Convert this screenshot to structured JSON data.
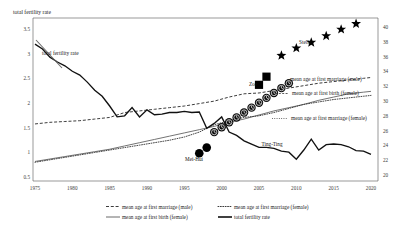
{
  "chart_data": {
    "type": "line",
    "title": "",
    "ylabel_left": "total fertility rate",
    "ylabel_right": "",
    "xlabel": "",
    "grid": false,
    "xlim": [
      1974,
      2021
    ],
    "ylim_left": [
      0.5,
      3.5
    ],
    "ylim_right": [
      20,
      40
    ],
    "xticks": [
      "1975",
      "1980",
      "1985",
      "1990",
      "1995",
      "2000",
      "2005",
      "2010",
      "2015",
      "2020"
    ],
    "yticks_left": [
      "3.5",
      "3",
      "2.5",
      "2",
      "1.5",
      "1",
      "0.5"
    ],
    "yticks_right": [
      "40",
      "38",
      "36",
      "34",
      "32",
      "30",
      "28",
      "26",
      "24",
      "22",
      "20"
    ],
    "legend_position": "bottom",
    "series": [
      {
        "name": "total fertility rate",
        "style": "solid-thick",
        "axis": "left",
        "x": [
          1975,
          1976,
          1977,
          1978,
          1979,
          1980,
          1981,
          1982,
          1983,
          1984,
          1985,
          1986,
          1987,
          1988,
          1989,
          1990,
          1991,
          1992,
          1993,
          1994,
          1995,
          1996,
          1997,
          1998,
          1999,
          2000,
          2001,
          2002,
          2003,
          2004,
          2005,
          2006,
          2007,
          2008,
          2009,
          2010,
          2011,
          2012,
          2013,
          2014,
          2015,
          2016,
          2017,
          2018,
          2019,
          2020
        ],
        "values": [
          3.02,
          2.93,
          2.78,
          2.69,
          2.62,
          2.52,
          2.45,
          2.32,
          2.17,
          2.06,
          1.88,
          1.68,
          1.7,
          1.85,
          1.68,
          1.81,
          1.72,
          1.73,
          1.76,
          1.76,
          1.78,
          1.76,
          1.77,
          1.47,
          1.56,
          1.68,
          1.4,
          1.34,
          1.24,
          1.18,
          1.12,
          1.12,
          1.1,
          1.05,
          1.03,
          0.9,
          1.07,
          1.27,
          1.07,
          1.17,
          1.18,
          1.17,
          1.13,
          1.06,
          1.05,
          0.99
        ]
      },
      {
        "name": "mean age at first marriage (male)",
        "style": "dashed",
        "axis": "right",
        "x": [
          1975,
          1977,
          1979,
          1981,
          1983,
          1985,
          1987,
          1989,
          1991,
          1993,
          1995,
          1997,
          1999,
          2001,
          2003,
          2005,
          2007,
          2009,
          2011,
          2013,
          2015,
          2017,
          2019,
          2020
        ],
        "values": [
          27.0,
          27.2,
          27.3,
          27.4,
          27.6,
          27.8,
          28.4,
          28.6,
          28.8,
          29.0,
          29.2,
          29.5,
          29.8,
          30.3,
          30.7,
          30.8,
          31.1,
          31.4,
          31.7,
          32.0,
          32.2,
          32.4,
          32.6,
          32.7
        ]
      },
      {
        "name": "mean age at first marriage (female)",
        "style": "dotted",
        "axis": "right",
        "x": [
          1975,
          1977,
          1979,
          1981,
          1983,
          1985,
          1987,
          1989,
          1991,
          1993,
          1995,
          1997,
          1999,
          2001,
          2003,
          2005,
          2007,
          2009,
          2011,
          2013,
          2015,
          2017,
          2019,
          2020
        ],
        "values": [
          22.3,
          22.6,
          22.9,
          23.2,
          23.5,
          23.8,
          24.1,
          24.4,
          24.7,
          25.0,
          25.4,
          26.0,
          26.9,
          27.4,
          27.8,
          28.0,
          28.4,
          28.9,
          29.4,
          29.7,
          30.0,
          30.2,
          30.4,
          30.5
        ]
      },
      {
        "name": "mean age at first birth (female)",
        "style": "solid-thin",
        "axis": "right",
        "x": [
          1975,
          1977,
          1979,
          1981,
          1983,
          1985,
          1987,
          1989,
          1991,
          1993,
          1995,
          1997,
          1999,
          2001,
          2003,
          2005,
          2007,
          2009,
          2011,
          2013,
          2015,
          2017,
          2019,
          2020
        ],
        "values": [
          22.4,
          22.7,
          23.0,
          23.3,
          23.6,
          23.9,
          24.3,
          24.7,
          25.1,
          25.5,
          25.9,
          26.3,
          26.7,
          27.2,
          27.6,
          28.1,
          28.6,
          29.0,
          29.4,
          29.9,
          30.3,
          30.7,
          30.9,
          31.0
        ]
      }
    ],
    "markers": [
      {
        "label": "Stella",
        "symbol": "star",
        "axis": "right",
        "points": [
          {
            "x": 2008,
            "y": 35.4
          },
          {
            "x": 2010,
            "y": 36.3
          },
          {
            "x": 2012,
            "y": 37.0
          },
          {
            "x": 2014,
            "y": 37.8
          },
          {
            "x": 2016,
            "y": 38.6
          },
          {
            "x": 2018,
            "y": 39.3
          }
        ]
      },
      {
        "label": "Zoe",
        "symbol": "square",
        "axis": "right",
        "points": [
          {
            "x": 2005,
            "y": 31.8
          },
          {
            "x": 2006,
            "y": 32.8
          }
        ]
      },
      {
        "label": "Ting-Ting",
        "symbol": "clock",
        "axis": "right",
        "points": [
          {
            "x": 1999,
            "y": 26.0
          },
          {
            "x": 2000,
            "y": 26.6
          },
          {
            "x": 2001,
            "y": 27.2
          },
          {
            "x": 2002,
            "y": 27.8
          },
          {
            "x": 2003,
            "y": 28.4
          },
          {
            "x": 2004,
            "y": 29.0
          },
          {
            "x": 2005,
            "y": 29.6
          },
          {
            "x": 2006,
            "y": 30.2
          },
          {
            "x": 2007,
            "y": 30.8
          },
          {
            "x": 2008,
            "y": 31.4
          },
          {
            "x": 2009,
            "y": 32.0
          }
        ]
      },
      {
        "label": "Mei-Hui",
        "symbol": "disc",
        "axis": "right",
        "points": [
          {
            "x": 1997,
            "y": 23.4
          },
          {
            "x": 1998,
            "y": 24.1
          }
        ]
      }
    ],
    "annotations": [
      {
        "text": "total fertility rate",
        "x": 1979.5,
        "target": "left-axis-curve"
      },
      {
        "text": "mean age at first marriage (male)",
        "x": 2007,
        "target": "dashed-curve"
      },
      {
        "text": "mean age at first birth (female)",
        "x": 2007,
        "target": "thin-solid-curve"
      },
      {
        "text": "mean age at first marriage (female)",
        "x": 2009,
        "target": "dotted-curve"
      },
      {
        "text": "Stella",
        "x": 2007,
        "target": "star-group"
      },
      {
        "text": "Zoe",
        "x": 2004,
        "target": "square-group"
      },
      {
        "text": "Ting-Ting",
        "x": 2007,
        "target": "clock-group"
      },
      {
        "text": "Mei-Hui",
        "x": 1994,
        "target": "disc-group"
      }
    ],
    "legend": [
      {
        "label": "mean age at first marriage (male)",
        "style": "dashed"
      },
      {
        "label": "mean age at first marriage (female)",
        "style": "dotted"
      },
      {
        "label": "mean age at first birth (female)",
        "style": "solid-thin"
      },
      {
        "label": "total fertility rate",
        "style": "solid-thick"
      }
    ],
    "colors": {
      "axis": "#555555",
      "line_primary": "#1a1a1a",
      "line_secondary": "#4a4a4a",
      "marker": "#000000",
      "background": "#ffffff"
    }
  }
}
